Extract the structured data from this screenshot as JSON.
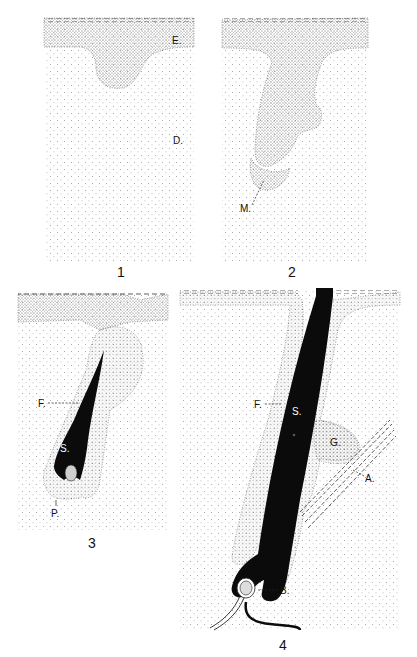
{
  "figure": {
    "panels": [
      {
        "number": "1",
        "labels": {
          "epidermis": "E.",
          "dermis": "D."
        }
      },
      {
        "number": "2",
        "labels": {
          "matrix": "M."
        }
      },
      {
        "number": "3",
        "labels": {
          "follicle": "F.",
          "shaft": "S.",
          "papilla": "P."
        }
      },
      {
        "number": "4",
        "labels": {
          "follicle": "F.",
          "shaft": "S.",
          "gland": "G.",
          "arrector": "A.",
          "bulb": "B."
        }
      }
    ],
    "colors": {
      "ink": "#111111",
      "background": "#ffffff",
      "stipple_light": "#9a9a9a",
      "stipple_dark": "#555555"
    }
  }
}
